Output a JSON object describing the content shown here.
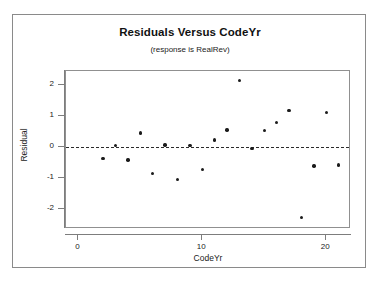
{
  "chart_data": {
    "type": "scatter",
    "title": "Residuals Versus CodeYr",
    "subtitle": "(response is RealRev)",
    "xlabel": "CodeYr",
    "ylabel": "Residual",
    "xlim": [
      -1,
      22
    ],
    "ylim": [
      -2.65,
      2.45
    ],
    "xticks": [
      0,
      10,
      20
    ],
    "xtick_labels": [
      "0",
      "10",
      "20"
    ],
    "yticks": [
      2,
      1,
      0,
      -1,
      -2
    ],
    "ytick_labels": [
      "2",
      "1",
      "0",
      "-1",
      "-2"
    ],
    "grid": false,
    "legend": null,
    "reference_line": {
      "orientation": "horizontal",
      "value": 0,
      "style": "dashed",
      "color": "#2a2a2a"
    },
    "marker": {
      "shape": "circle",
      "color": "#1b1b1b",
      "size": 3.4
    },
    "x": [
      2,
      3,
      4,
      5,
      6,
      7,
      8,
      9,
      10,
      11,
      12,
      13,
      14,
      15,
      16,
      17,
      18,
      19,
      20,
      21
    ],
    "y": [
      -0.38,
      0.05,
      -0.42,
      0.45,
      -0.85,
      0.06,
      -1.05,
      0.05,
      -0.72,
      0.22,
      0.55,
      2.15,
      -0.05,
      0.53,
      0.78,
      1.18,
      -2.28,
      -0.62,
      1.12,
      -0.58
    ],
    "points": [
      {
        "x": 2,
        "y": -0.38
      },
      {
        "x": 3,
        "y": 0.05
      },
      {
        "x": 4,
        "y": -0.42
      },
      {
        "x": 5,
        "y": 0.45
      },
      {
        "x": 6,
        "y": -0.85
      },
      {
        "x": 7,
        "y": 0.06
      },
      {
        "x": 8,
        "y": -1.05
      },
      {
        "x": 9,
        "y": 0.05
      },
      {
        "x": 10,
        "y": -0.72
      },
      {
        "x": 11,
        "y": 0.22
      },
      {
        "x": 12,
        "y": 0.55
      },
      {
        "x": 13,
        "y": 2.15
      },
      {
        "x": 14,
        "y": -0.05
      },
      {
        "x": 15,
        "y": 0.53
      },
      {
        "x": 16,
        "y": 0.78
      },
      {
        "x": 17,
        "y": 1.18
      },
      {
        "x": 18,
        "y": -2.28
      },
      {
        "x": 19,
        "y": -0.62
      },
      {
        "x": 20,
        "y": 1.12
      },
      {
        "x": 21,
        "y": -0.58
      }
    ]
  },
  "colors": {
    "frame": "#8a8a8a",
    "axis": "#7d7d7d",
    "marker": "#1b1b1b",
    "reference_line": "#2a2a2a",
    "background": "#ffffff",
    "text": "#1a1a1a"
  }
}
